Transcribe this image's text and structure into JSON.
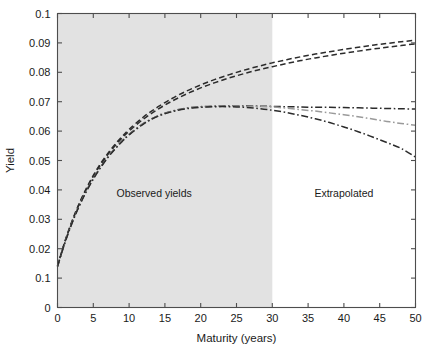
{
  "chart_data": {
    "type": "line",
    "title": "",
    "xlabel": "Maturity (years)",
    "ylabel": "Yield",
    "xlim": [
      0,
      50
    ],
    "ylim": [
      0,
      0.1
    ],
    "grid": false,
    "legend_position": "none",
    "xticks": [
      0,
      5,
      10,
      15,
      20,
      25,
      30,
      35,
      40,
      45,
      50
    ],
    "xtick_labels": [
      "0",
      "5",
      "10",
      "15",
      "20",
      "25",
      "30",
      "35",
      "40",
      "45",
      "50"
    ],
    "yticks": [
      0,
      0.01,
      0.02,
      0.03,
      0.04,
      0.05,
      0.06,
      0.07,
      0.08,
      0.09,
      0.1
    ],
    "ytick_labels": [
      "0",
      "0.1",
      "0.02",
      "0.03",
      "0.04",
      "0.05",
      "0.06",
      "0.07",
      "0.08",
      "0.09",
      "0.1"
    ],
    "annotations": [
      {
        "text": "Observed yields",
        "x": 13.5,
        "y": 0.0375
      },
      {
        "text": "Extrapolated",
        "x": 40.0,
        "y": 0.0375
      }
    ],
    "shaded_regions": [
      {
        "name": "observed",
        "x_start": 0,
        "x_end": 30,
        "color": "#e2e2e2"
      }
    ],
    "x": [
      0,
      1,
      2,
      3,
      4,
      5,
      6,
      7,
      8,
      9,
      10,
      12,
      14,
      16,
      18,
      20,
      22,
      24,
      26,
      28,
      30,
      32,
      34,
      36,
      38,
      40,
      42,
      44,
      46,
      48,
      50
    ],
    "series": [
      {
        "name": "curve-1-dashed-upper",
        "style": "dashed",
        "color": "#2b2b2b",
        "values": [
          0.014,
          0.0222,
          0.0292,
          0.0352,
          0.0404,
          0.0449,
          0.0489,
          0.0523,
          0.0554,
          0.0581,
          0.0606,
          0.0648,
          0.0682,
          0.0711,
          0.0736,
          0.0757,
          0.0776,
          0.0792,
          0.0807,
          0.082,
          0.0832,
          0.0843,
          0.0853,
          0.0862,
          0.087,
          0.0878,
          0.0885,
          0.0892,
          0.0898,
          0.0904,
          0.0909
        ]
      },
      {
        "name": "curve-2-dashed-lower",
        "style": "dashed",
        "color": "#2b2b2b",
        "values": [
          0.014,
          0.0221,
          0.029,
          0.035,
          0.0401,
          0.0446,
          0.0485,
          0.0519,
          0.0549,
          0.0576,
          0.06,
          0.0641,
          0.0674,
          0.0702,
          0.0726,
          0.0747,
          0.0765,
          0.0781,
          0.0795,
          0.0808,
          0.0819,
          0.083,
          0.084,
          0.0849,
          0.0857,
          0.0865,
          0.0872,
          0.0879,
          0.0885,
          0.0891,
          0.0897
        ]
      },
      {
        "name": "curve-3-dashdot-flat",
        "style": "dashdot",
        "color": "#2b2b2b",
        "values": [
          0.014,
          0.0219,
          0.0287,
          0.0345,
          0.0395,
          0.0439,
          0.0477,
          0.0511,
          0.054,
          0.0566,
          0.0589,
          0.0626,
          0.0652,
          0.0668,
          0.0678,
          0.0683,
          0.0685,
          0.0686,
          0.0686,
          0.0685,
          0.0684,
          0.0683,
          0.0682,
          0.0681,
          0.0681,
          0.068,
          0.0679,
          0.0678,
          0.0677,
          0.0676,
          0.0675
        ]
      },
      {
        "name": "curve-4-dashdot-light",
        "style": "dashdot",
        "color": "#9a9a9a",
        "values": [
          0.014,
          0.0218,
          0.0286,
          0.0344,
          0.0394,
          0.0438,
          0.0476,
          0.051,
          0.0539,
          0.0565,
          0.0588,
          0.0625,
          0.0651,
          0.0667,
          0.0677,
          0.0682,
          0.0684,
          0.0685,
          0.0685,
          0.0684,
          0.0682,
          0.0678,
          0.0673,
          0.0668,
          0.0662,
          0.0656,
          0.0649,
          0.0641,
          0.0633,
          0.0626,
          0.062
        ]
      },
      {
        "name": "curve-5-dashdot-falling",
        "style": "dashdot",
        "color": "#2b2b2b",
        "values": [
          0.014,
          0.0218,
          0.0285,
          0.0343,
          0.0393,
          0.0437,
          0.0475,
          0.0509,
          0.0538,
          0.0564,
          0.0587,
          0.0624,
          0.065,
          0.0666,
          0.0676,
          0.0681,
          0.0683,
          0.0683,
          0.0681,
          0.0677,
          0.0671,
          0.0663,
          0.0653,
          0.0642,
          0.0629,
          0.0614,
          0.0598,
          0.058,
          0.0561,
          0.0541,
          0.0512
        ]
      }
    ]
  }
}
